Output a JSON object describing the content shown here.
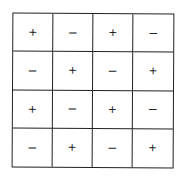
{
  "grid": {
    "rows": 4,
    "cols": 4,
    "cells": [
      [
        "+",
        "−",
        "+",
        "−"
      ],
      [
        "−",
        "+",
        "−",
        "+"
      ],
      [
        "+",
        "−",
        "+",
        "−"
      ],
      [
        "−",
        "+",
        "−",
        "+"
      ]
    ],
    "border_color": "#222222",
    "symbol_color": "#222222"
  }
}
